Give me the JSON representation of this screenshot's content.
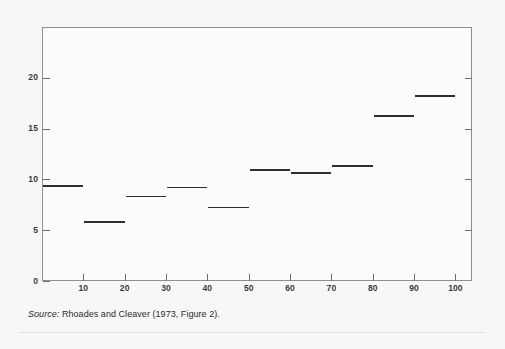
{
  "figure": {
    "source_note_label": "Source:",
    "source_note_text": " Rhoades and Cleaver (1973, Figure 2)."
  },
  "colors": {
    "panel_background": "#f7f7f7",
    "plot_background": "#fcfcfc",
    "axis": "#8e8e93",
    "tick": "#6f6f73",
    "data_line": "#2f2f31",
    "label_text": "#3a3a3c"
  },
  "chart_data": {
    "type": "bar",
    "title": "",
    "subtitle": "",
    "xlabel": "",
    "ylabel": "",
    "xlim": [
      0,
      104
    ],
    "ylim": [
      0,
      25
    ],
    "grid": false,
    "legend": null,
    "style": "step-segments (horizontal level marks per decile bin)",
    "xtick_labels": [
      "10",
      "20",
      "30",
      "40",
      "50",
      "60",
      "70",
      "80",
      "90",
      "100"
    ],
    "xtick_values": [
      10,
      20,
      30,
      40,
      50,
      60,
      70,
      80,
      90,
      100
    ],
    "ytick_labels": [
      "0",
      "5",
      "10",
      "15",
      "20"
    ],
    "ytick_values": [
      0,
      5,
      10,
      15,
      20
    ],
    "categories": [
      "0-10",
      "10-20",
      "20-30",
      "30-40",
      "40-50",
      "50-60",
      "60-70",
      "70-80",
      "80-90",
      "90-100"
    ],
    "bins": [
      {
        "x_start": 0,
        "x_end": 10,
        "value": 9.4
      },
      {
        "x_start": 10,
        "x_end": 20,
        "value": 5.9
      },
      {
        "x_start": 20,
        "x_end": 30,
        "value": 8.4
      },
      {
        "x_start": 30,
        "x_end": 40,
        "value": 9.3
      },
      {
        "x_start": 40,
        "x_end": 50,
        "value": 7.3
      },
      {
        "x_start": 50,
        "x_end": 60,
        "value": 11.0
      },
      {
        "x_start": 60,
        "x_end": 70,
        "value": 10.7
      },
      {
        "x_start": 70,
        "x_end": 80,
        "value": 11.4
      },
      {
        "x_start": 80,
        "x_end": 90,
        "value": 16.3
      },
      {
        "x_start": 90,
        "x_end": 100,
        "value": 18.3
      }
    ],
    "values": [
      9.4,
      5.9,
      8.4,
      9.3,
      7.3,
      11.0,
      10.7,
      11.4,
      16.3,
      18.3
    ]
  }
}
